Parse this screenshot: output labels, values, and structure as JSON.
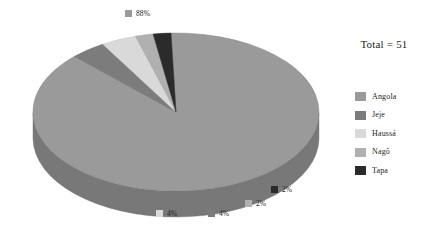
{
  "chart_data": {
    "type": "pie",
    "title": "",
    "total_label": "Total = 51",
    "total_value": 51,
    "categories": [
      "Angola",
      "Jeje",
      "Haussá",
      "Nagô",
      "Tapa"
    ],
    "values": [
      88,
      4,
      4,
      2,
      2
    ],
    "value_labels": [
      "88%",
      "4%",
      "4%",
      "2%",
      "2%"
    ],
    "units": "percent",
    "legend_position": "right",
    "grid": false,
    "three_d": true,
    "colors": [
      "#9a9a9a",
      "#7c7c7c",
      "#d9d9d9",
      "#b0b0b0",
      "#2b2b2b"
    ]
  },
  "callouts": [
    {
      "name": "angola",
      "label": "88%",
      "color": "#9a9a9a"
    },
    {
      "name": "haussa",
      "label": "4%",
      "color": "#d9d9d9"
    },
    {
      "name": "jeje",
      "label": "4%",
      "color": "#7c7c7c"
    },
    {
      "name": "nago",
      "label": "2%",
      "color": "#b0b0b0"
    },
    {
      "name": "tapa",
      "label": "2%",
      "color": "#2b2b2b"
    }
  ],
  "legend": {
    "items": [
      {
        "label": "Angola",
        "color": "#9a9a9a"
      },
      {
        "label": "Jeje",
        "color": "#7c7c7c"
      },
      {
        "label": "Haussá",
        "color": "#d9d9d9"
      },
      {
        "label": "Nagô",
        "color": "#b0b0b0"
      },
      {
        "label": "Tapa",
        "color": "#2b2b2b"
      }
    ]
  },
  "side": {
    "total_text": "Total = 51"
  }
}
